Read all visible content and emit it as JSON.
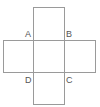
{
  "figure": {
    "type": "cube-net-cross",
    "stroke_color": "#9a9a9a",
    "label_color": "#555555",
    "squares": [
      {
        "name": "top",
        "x": 33.5,
        "y": 7.5,
        "w": 31,
        "h": 33
      },
      {
        "name": "left",
        "x": 3.5,
        "y": 40.5,
        "w": 30,
        "h": 32
      },
      {
        "name": "center",
        "x": 33.5,
        "y": 40.5,
        "w": 31,
        "h": 32
      },
      {
        "name": "right",
        "x": 64.5,
        "y": 40.5,
        "w": 31,
        "h": 32
      },
      {
        "name": "bottom",
        "x": 33.5,
        "y": 72.5,
        "w": 31,
        "h": 32
      }
    ],
    "labels": [
      {
        "text": "A",
        "x": 25,
        "y": 37
      },
      {
        "text": "B",
        "x": 66,
        "y": 37
      },
      {
        "text": "D",
        "x": 25,
        "y": 83
      },
      {
        "text": "C",
        "x": 66,
        "y": 83
      }
    ]
  }
}
